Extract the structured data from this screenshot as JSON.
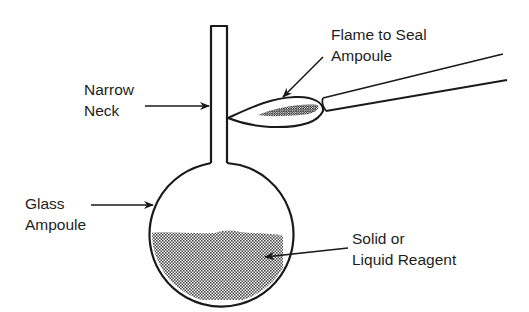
{
  "diagram": {
    "type": "labeled-illustration",
    "labels": {
      "narrow_neck": {
        "line1": "Narrow",
        "line2": "Neck"
      },
      "flame": {
        "line1": "Flame to Seal",
        "line2": "Ampoule"
      },
      "glass_ampoule": {
        "line1": "Glass",
        "line2": "Ampoule"
      },
      "reagent": {
        "line1": "Solid or",
        "line2": "Liquid Reagent"
      }
    },
    "colors": {
      "stroke": "#1a1a1a",
      "fill_pattern_dark": "#555555",
      "background": "#ffffff"
    }
  }
}
